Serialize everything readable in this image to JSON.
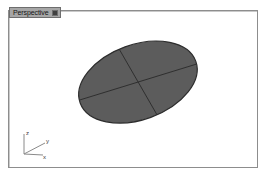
{
  "window": {
    "background_color": "#ffffff"
  },
  "viewport": {
    "title": "Perspective",
    "title_tab_bg": "#a6a6a6",
    "title_tab_border": "#6e6e6e",
    "dropdown_marker": "viewport-menu-marker",
    "frame_border_color": "#8d8d8d",
    "background_color": "#ffffff",
    "projection": "Perspective"
  },
  "geometry": {
    "name": "ellipse-disc",
    "fill_color": "#5c5c5c",
    "edge_color": "#2d2d2d",
    "isocurve_color": "#2f2f2f",
    "shape": "ellipse",
    "center_x": 138,
    "center_y": 82,
    "radius_x": 62,
    "radius_y": 38,
    "rotation_deg": -20,
    "isocurve_count": 2
  },
  "axis_gizmo": {
    "name": "world-axis-indicator",
    "origin_label": "",
    "axes": [
      {
        "id": "z",
        "label": "z",
        "direction": "up"
      },
      {
        "id": "y",
        "label": "y",
        "direction": "right"
      },
      {
        "id": "x",
        "label": "x",
        "direction": "down-right"
      }
    ],
    "line_color": "#8a8a8a",
    "label_color": "#3a3a3a"
  }
}
